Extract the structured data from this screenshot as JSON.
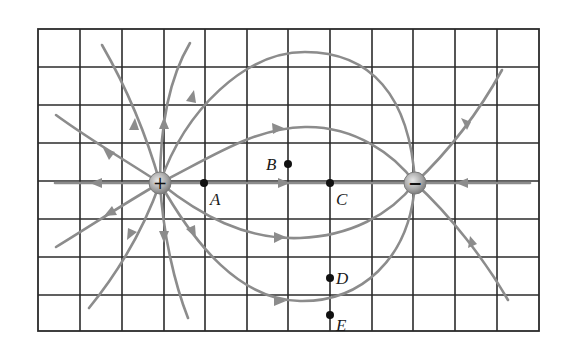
{
  "diagram": {
    "grid": {
      "columns": 12,
      "rows": 8,
      "left": 38,
      "top": 29,
      "right": 539,
      "bottom": 331,
      "line_color": "#2b2b2b"
    },
    "field_line_color": "#8c8c8c",
    "charges": [
      {
        "id": "positive",
        "sign": "+",
        "x": 160,
        "y": 183
      },
      {
        "id": "negative",
        "sign": "−",
        "x": 415,
        "y": 183
      }
    ],
    "points": [
      {
        "label": "A",
        "x": 204,
        "y": 183,
        "label_dx": 6,
        "label_dy": 22
      },
      {
        "label": "B",
        "x": 288,
        "y": 164,
        "label_dx": -22,
        "label_dy": 6
      },
      {
        "label": "C",
        "x": 330,
        "y": 183,
        "label_dx": 6,
        "label_dy": 22
      },
      {
        "label": "D",
        "x": 330,
        "y": 278,
        "label_dx": 6,
        "label_dy": 6
      },
      {
        "label": "E",
        "x": 330,
        "y": 315,
        "label_dx": 6,
        "label_dy": 18
      }
    ]
  }
}
